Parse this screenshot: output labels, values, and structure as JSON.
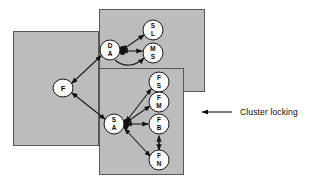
{
  "figure": {
    "title": "Cluster locking",
    "background_color": "#ffffff",
    "cluster_fill": "#bcbcbc",
    "cluster_stroke": "#58585a",
    "node_fill": "#fbfbfb",
    "node_stroke": "#1a1a1a",
    "edge_color": "#1a1a1a"
  },
  "annotation": {
    "label": "Cluster locking",
    "arrow_icon": "left-arrow-icon",
    "arrow_direction": "left"
  },
  "clusters": [
    {
      "id": "cluster-left",
      "name": "left-cluster",
      "x": 13,
      "y": 31,
      "width": 86,
      "height": 115
    },
    {
      "id": "cluster-top-right",
      "name": "top-right-cluster",
      "x": 99,
      "y": 9,
      "width": 106,
      "height": 83
    },
    {
      "id": "cluster-bottom-right",
      "name": "bottom-right-cluster",
      "x": 99,
      "y": 68,
      "width": 85,
      "height": 107
    }
  ],
  "nodes": [
    {
      "id": "f",
      "name": "node-f",
      "lines": [
        "F"
      ],
      "cx": 63,
      "cy": 88,
      "rx": 10,
      "ry": 9,
      "cluster": "cluster-left"
    },
    {
      "id": "da",
      "name": "node-da",
      "lines": [
        "D",
        "A"
      ],
      "cx": 110,
      "cy": 50,
      "rx": 10,
      "ry": 10,
      "cluster": "cluster-top-right"
    },
    {
      "id": "sl",
      "name": "node-sl",
      "lines": [
        "S",
        "L"
      ],
      "cx": 153,
      "cy": 30,
      "rx": 10,
      "ry": 10,
      "cluster": "cluster-top-right"
    },
    {
      "id": "ms",
      "name": "node-ms",
      "lines": [
        "M",
        "S"
      ],
      "cx": 153,
      "cy": 53,
      "rx": 10,
      "ry": 10,
      "cluster": "cluster-top-right"
    },
    {
      "id": "sa",
      "name": "node-sa",
      "lines": [
        "S",
        "A"
      ],
      "cx": 114,
      "cy": 124,
      "rx": 10,
      "ry": 10,
      "cluster": "cluster-bottom-right"
    },
    {
      "id": "fs",
      "name": "node-fs",
      "lines": [
        "F",
        "S"
      ],
      "cx": 159,
      "cy": 82,
      "rx": 10,
      "ry": 10,
      "cluster": "cluster-bottom-right"
    },
    {
      "id": "fm",
      "name": "node-fm",
      "lines": [
        "F",
        "M"
      ],
      "cx": 159,
      "cy": 102,
      "rx": 10,
      "ry": 10,
      "cluster": "cluster-bottom-right"
    },
    {
      "id": "fb",
      "name": "node-fb",
      "lines": [
        "F",
        "B"
      ],
      "cx": 159,
      "cy": 124,
      "rx": 10,
      "ry": 10,
      "cluster": "cluster-bottom-right"
    },
    {
      "id": "fn",
      "name": "node-fn",
      "lines": [
        "F",
        "N"
      ],
      "cx": 159,
      "cy": 160,
      "rx": 10,
      "ry": 10,
      "cluster": "cluster-bottom-right"
    }
  ],
  "edges": [
    {
      "id": "e-f-da",
      "from": "f",
      "to": "da",
      "arrows": "both"
    },
    {
      "id": "e-f-sa",
      "from": "f",
      "to": "sa",
      "arrows": "both"
    },
    {
      "id": "e-da-sl",
      "from": "da",
      "to": "sl",
      "arrows": "both"
    },
    {
      "id": "e-da-ms",
      "from": "da",
      "to": "ms",
      "arrows": "both"
    },
    {
      "id": "e-da-ms-curve",
      "from": "da",
      "to": "ms",
      "arrows": "to",
      "style": "curved"
    },
    {
      "id": "e-sa-fs",
      "from": "sa",
      "to": "fs",
      "arrows": "both"
    },
    {
      "id": "e-sa-fm",
      "from": "sa",
      "to": "fm",
      "arrows": "both"
    },
    {
      "id": "e-sa-fb",
      "from": "sa",
      "to": "fb",
      "arrows": "both"
    },
    {
      "id": "e-sa-fn",
      "from": "sa",
      "to": "fn",
      "arrows": "both"
    },
    {
      "id": "e-fb-fn",
      "from": "fb",
      "to": "fn",
      "arrows": "both"
    }
  ]
}
